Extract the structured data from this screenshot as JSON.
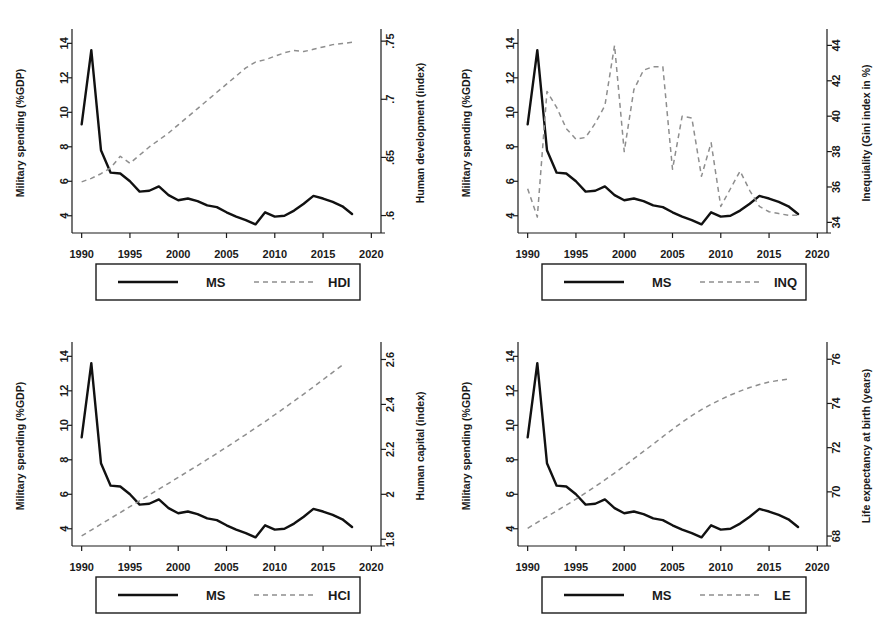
{
  "figure": {
    "panel_count": 4,
    "shared_xlabel": "",
    "shared_x_ticks": [
      "1990",
      "1995",
      "2000",
      "2005",
      "2010",
      "2015",
      "2020"
    ],
    "ms_axis_ticks": [
      "4",
      "6",
      "8",
      "10",
      "12",
      "14"
    ],
    "ms_axis_label": "Military spending (%GDP)",
    "ms_legend_label": "MS",
    "colors": {
      "ms_line": "#111111",
      "secondary_line": "#8e8e8e",
      "axis": "#1a1a1a",
      "background": "#ffffff"
    }
  },
  "chart_data": [
    {
      "type": "line",
      "title": "",
      "panel_id": "hdi",
      "xlabel": "",
      "ylabel": "Military spending (%GDP)",
      "y2label": "Human development (index)",
      "xlim": [
        1989,
        2021
      ],
      "ylim": [
        3,
        14.6
      ],
      "y2lim": [
        0.585,
        0.757
      ],
      "xticks": [
        1990,
        1995,
        2000,
        2005,
        2010,
        2015,
        2020
      ],
      "xticklabels": [
        "1990",
        "1995",
        "2000",
        "2005",
        "2010",
        "2015",
        "2020"
      ],
      "yticks": [
        4,
        6,
        8,
        10,
        12,
        14
      ],
      "yticklabels": [
        "4",
        "6",
        "8",
        "10",
        "12",
        "14"
      ],
      "y2ticks": [
        0.6,
        0.65,
        0.7,
        0.75
      ],
      "y2ticklabels": [
        ".6",
        ".65",
        ".7",
        ".75"
      ],
      "grid": false,
      "legend_position": "below",
      "series": [
        {
          "name": "MS",
          "legend": "MS",
          "axis": "left",
          "style": "solid",
          "x": [
            1990,
            1991,
            1992,
            1993,
            1994,
            1995,
            1996,
            1997,
            1998,
            1999,
            2000,
            2001,
            2002,
            2003,
            2004,
            2005,
            2006,
            2007,
            2008,
            2009,
            2010,
            2011,
            2012,
            2013,
            2014,
            2015,
            2016,
            2017,
            2018
          ],
          "values": [
            9.3,
            13.6,
            7.8,
            6.5,
            6.45,
            6.0,
            5.4,
            5.45,
            5.7,
            5.2,
            4.9,
            5.0,
            4.85,
            4.6,
            4.5,
            4.2,
            3.95,
            3.75,
            3.5,
            4.2,
            3.95,
            4.0,
            4.3,
            4.7,
            5.15,
            5.0,
            4.8,
            4.55,
            4.1
          ]
        },
        {
          "name": "HDI",
          "legend": "HDI",
          "axis": "right",
          "style": "dashed",
          "x": [
            1990,
            1991,
            1992,
            1993,
            1994,
            1995,
            1996,
            1997,
            1998,
            1999,
            2000,
            2001,
            2002,
            2003,
            2004,
            2005,
            2006,
            2007,
            2008,
            2009,
            2010,
            2011,
            2012,
            2013,
            2014,
            2015,
            2016,
            2017,
            2018
          ],
          "values": [
            0.629,
            0.632,
            0.636,
            0.641,
            0.651,
            0.645,
            0.652,
            0.659,
            0.665,
            0.671,
            0.678,
            0.685,
            0.692,
            0.699,
            0.706,
            0.713,
            0.72,
            0.727,
            0.732,
            0.734,
            0.737,
            0.74,
            0.742,
            0.741,
            0.743,
            0.745,
            0.747,
            0.748,
            0.749
          ]
        }
      ]
    },
    {
      "type": "line",
      "title": "",
      "panel_id": "inq",
      "xlabel": "",
      "ylabel": "Military spending (%GDP)",
      "y2label": "Inequiality (Gini index in %)",
      "xlim": [
        1989,
        2021
      ],
      "ylim": [
        3,
        14.6
      ],
      "y2lim": [
        33.4,
        44.7
      ],
      "xticks": [
        1990,
        1995,
        2000,
        2005,
        2010,
        2015,
        2020
      ],
      "xticklabels": [
        "1990",
        "1995",
        "2000",
        "2005",
        "2010",
        "2015",
        "2020"
      ],
      "yticks": [
        4,
        6,
        8,
        10,
        12,
        14
      ],
      "yticklabels": [
        "4",
        "6",
        "8",
        "10",
        "12",
        "14"
      ],
      "y2ticks": [
        34,
        36,
        38,
        40,
        42,
        44
      ],
      "y2ticklabels": [
        "34",
        "36",
        "38",
        "40",
        "42",
        "44"
      ],
      "grid": false,
      "legend_position": "below",
      "series": [
        {
          "name": "MS",
          "legend": "MS",
          "axis": "left",
          "style": "solid",
          "x": [
            1990,
            1991,
            1992,
            1993,
            1994,
            1995,
            1996,
            1997,
            1998,
            1999,
            2000,
            2001,
            2002,
            2003,
            2004,
            2005,
            2006,
            2007,
            2008,
            2009,
            2010,
            2011,
            2012,
            2013,
            2014,
            2015,
            2016,
            2017,
            2018
          ],
          "values": [
            9.3,
            13.6,
            7.8,
            6.5,
            6.45,
            6.0,
            5.4,
            5.45,
            5.7,
            5.2,
            4.9,
            5.0,
            4.85,
            4.6,
            4.5,
            4.2,
            3.95,
            3.75,
            3.5,
            4.2,
            3.95,
            4.0,
            4.3,
            4.7,
            5.15,
            5.0,
            4.8,
            4.55,
            4.1
          ]
        },
        {
          "name": "INQ",
          "legend": "INQ",
          "axis": "right",
          "style": "dashed",
          "x": [
            1990,
            1991,
            1992,
            1993,
            1994,
            1995,
            1996,
            1997,
            1998,
            1999,
            2000,
            2001,
            2002,
            2003,
            2004,
            2005,
            2006,
            2007,
            2008,
            2009,
            2010,
            2011,
            2012,
            2013,
            2014,
            2015,
            2016,
            2017,
            2018
          ],
          "values": [
            35.9,
            34.3,
            41.4,
            40.5,
            39.3,
            38.7,
            38.8,
            39.6,
            40.6,
            44.0,
            38.0,
            41.5,
            42.6,
            42.8,
            42.8,
            37.0,
            40.0,
            39.9,
            36.6,
            38.5,
            34.9,
            35.9,
            36.9,
            35.8,
            34.9,
            34.6,
            34.5,
            34.4,
            34.4
          ]
        }
      ]
    },
    {
      "type": "line",
      "title": "",
      "panel_id": "hci",
      "xlabel": "",
      "ylabel": "Military spending (%GDP)",
      "y2label": "Human capital (index)",
      "xlim": [
        1989,
        2021
      ],
      "ylim": [
        3,
        14.6
      ],
      "y2lim": [
        1.77,
        2.66
      ],
      "xticks": [
        1990,
        1995,
        2000,
        2005,
        2010,
        2015,
        2020
      ],
      "xticklabels": [
        "1990",
        "1995",
        "2000",
        "2005",
        "2010",
        "2015",
        "2020"
      ],
      "yticks": [
        4,
        6,
        8,
        10,
        12,
        14
      ],
      "yticklabels": [
        "4",
        "6",
        "8",
        "10",
        "12",
        "14"
      ],
      "y2ticks": [
        1.8,
        2.0,
        2.2,
        2.4,
        2.6
      ],
      "y2ticklabels": [
        "1.8",
        "2",
        "2.2",
        "2.4",
        "2.6"
      ],
      "grid": false,
      "legend_position": "below",
      "series": [
        {
          "name": "MS",
          "legend": "MS",
          "axis": "left",
          "style": "solid",
          "x": [
            1990,
            1991,
            1992,
            1993,
            1994,
            1995,
            1996,
            1997,
            1998,
            1999,
            2000,
            2001,
            2002,
            2003,
            2004,
            2005,
            2006,
            2007,
            2008,
            2009,
            2010,
            2011,
            2012,
            2013,
            2014,
            2015,
            2016,
            2017,
            2018
          ],
          "values": [
            9.3,
            13.6,
            7.8,
            6.5,
            6.45,
            6.0,
            5.4,
            5.45,
            5.7,
            5.2,
            4.9,
            5.0,
            4.85,
            4.6,
            4.5,
            4.2,
            3.95,
            3.75,
            3.5,
            4.2,
            3.95,
            4.0,
            4.3,
            4.7,
            5.15,
            5.0,
            4.8,
            4.55,
            4.1
          ]
        },
        {
          "name": "HCI",
          "legend": "HCI",
          "axis": "right",
          "style": "dashed",
          "x": [
            1990,
            1991,
            1992,
            1993,
            1994,
            1995,
            1996,
            1997,
            1998,
            1999,
            2000,
            2001,
            2002,
            2003,
            2004,
            2005,
            2006,
            2007,
            2008,
            2009,
            2010,
            2011,
            2012,
            2013,
            2014,
            2015,
            2016,
            2017
          ],
          "values": [
            1.815,
            1.841,
            1.867,
            1.893,
            1.919,
            1.945,
            1.971,
            1.997,
            2.023,
            2.049,
            2.075,
            2.102,
            2.128,
            2.155,
            2.182,
            2.21,
            2.238,
            2.266,
            2.295,
            2.324,
            2.354,
            2.384,
            2.415,
            2.446,
            2.478,
            2.51,
            2.543,
            2.575
          ]
        }
      ]
    },
    {
      "type": "line",
      "title": "",
      "panel_id": "le",
      "xlabel": "",
      "ylabel": "Military spending (%GDP)",
      "y2label": "Life expectancy at birth (years)",
      "xlim": [
        1989,
        2021
      ],
      "ylim": [
        3,
        14.6
      ],
      "y2lim": [
        67.55,
        76.6
      ],
      "xticks": [
        1990,
        1995,
        2000,
        2005,
        2010,
        2015,
        2020
      ],
      "xticklabels": [
        "1990",
        "1995",
        "2000",
        "2005",
        "2010",
        "2015",
        "2020"
      ],
      "yticks": [
        4,
        6,
        8,
        10,
        12,
        14
      ],
      "yticklabels": [
        "4",
        "6",
        "8",
        "10",
        "12",
        "14"
      ],
      "y2ticks": [
        68,
        70,
        72,
        74,
        76
      ],
      "y2ticklabels": [
        "68",
        "70",
        "72",
        "74",
        "76"
      ],
      "grid": false,
      "legend_position": "below",
      "series": [
        {
          "name": "MS",
          "legend": "MS",
          "axis": "left",
          "style": "solid",
          "x": [
            1990,
            1991,
            1992,
            1993,
            1994,
            1995,
            1996,
            1997,
            1998,
            1999,
            2000,
            2001,
            2002,
            2003,
            2004,
            2005,
            2006,
            2007,
            2008,
            2009,
            2010,
            2011,
            2012,
            2013,
            2014,
            2015,
            2016,
            2017,
            2018
          ],
          "values": [
            9.3,
            13.6,
            7.8,
            6.5,
            6.45,
            6.0,
            5.4,
            5.45,
            5.7,
            5.2,
            4.9,
            5.0,
            4.85,
            4.6,
            4.5,
            4.2,
            3.95,
            3.75,
            3.5,
            4.2,
            3.95,
            4.0,
            4.3,
            4.7,
            5.15,
            5.0,
            4.8,
            4.55,
            4.1
          ]
        },
        {
          "name": "LE",
          "legend": "LE",
          "axis": "right",
          "style": "dashed",
          "x": [
            1990,
            1991,
            1992,
            1993,
            1994,
            1995,
            1996,
            1997,
            1998,
            1999,
            2000,
            2001,
            2002,
            2003,
            2004,
            2005,
            2006,
            2007,
            2008,
            2009,
            2010,
            2011,
            2012,
            2013,
            2014,
            2015,
            2016,
            2017
          ],
          "values": [
            68.35,
            68.62,
            68.88,
            69.14,
            69.4,
            69.67,
            69.95,
            70.24,
            70.54,
            70.85,
            71.17,
            71.5,
            71.83,
            72.16,
            72.5,
            72.83,
            73.15,
            73.45,
            73.72,
            73.96,
            74.18,
            74.38,
            74.56,
            74.72,
            74.86,
            74.97,
            75.04,
            75.1
          ]
        }
      ]
    }
  ]
}
